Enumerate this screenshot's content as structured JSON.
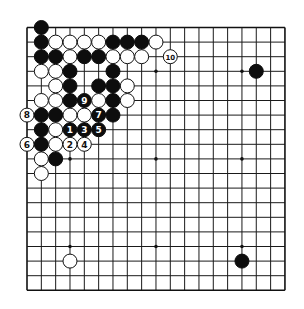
{
  "board": {
    "size": 19,
    "origin_x": 27,
    "origin_y": 27.5,
    "spacing_x": 14.33,
    "spacing_y": 14.6,
    "stone_radius": 7,
    "colors": {
      "black": "#0d0d0d",
      "white": "#ffffff",
      "line": "#1a1a1a"
    },
    "star_points": [
      [
        3,
        3
      ],
      [
        9,
        3
      ],
      [
        15,
        3
      ],
      [
        3,
        9
      ],
      [
        9,
        9
      ],
      [
        15,
        9
      ],
      [
        3,
        15
      ],
      [
        9,
        15
      ],
      [
        15,
        15
      ]
    ]
  },
  "stones": [
    {
      "c": 1,
      "r": 0,
      "color": "black"
    },
    {
      "c": 1,
      "r": 1,
      "color": "black"
    },
    {
      "c": 2,
      "r": 1,
      "color": "white"
    },
    {
      "c": 3,
      "r": 1,
      "color": "white"
    },
    {
      "c": 4,
      "r": 1,
      "color": "white"
    },
    {
      "c": 5,
      "r": 1,
      "color": "white"
    },
    {
      "c": 6,
      "r": 1,
      "color": "black"
    },
    {
      "c": 7,
      "r": 1,
      "color": "black"
    },
    {
      "c": 8,
      "r": 1,
      "color": "black"
    },
    {
      "c": 9,
      "r": 1,
      "color": "white"
    },
    {
      "c": 1,
      "r": 2,
      "color": "black"
    },
    {
      "c": 2,
      "r": 2,
      "color": "black"
    },
    {
      "c": 3,
      "r": 2,
      "color": "white"
    },
    {
      "c": 4,
      "r": 2,
      "color": "black"
    },
    {
      "c": 5,
      "r": 2,
      "color": "black"
    },
    {
      "c": 6,
      "r": 2,
      "color": "white"
    },
    {
      "c": 7,
      "r": 2,
      "color": "white"
    },
    {
      "c": 8,
      "r": 2,
      "color": "white"
    },
    {
      "c": 10,
      "r": 2,
      "color": "white",
      "label": "10"
    },
    {
      "c": 1,
      "r": 3,
      "color": "white"
    },
    {
      "c": 2,
      "r": 3,
      "color": "white"
    },
    {
      "c": 3,
      "r": 3,
      "color": "black"
    },
    {
      "c": 6,
      "r": 3,
      "color": "black"
    },
    {
      "c": 16,
      "r": 3,
      "color": "black"
    },
    {
      "c": 2,
      "r": 4,
      "color": "white"
    },
    {
      "c": 3,
      "r": 4,
      "color": "black"
    },
    {
      "c": 5,
      "r": 4,
      "color": "black"
    },
    {
      "c": 6,
      "r": 4,
      "color": "black"
    },
    {
      "c": 7,
      "r": 4,
      "color": "white"
    },
    {
      "c": 1,
      "r": 5,
      "color": "white"
    },
    {
      "c": 2,
      "r": 5,
      "color": "white"
    },
    {
      "c": 3,
      "r": 5,
      "color": "black"
    },
    {
      "c": 4,
      "r": 5,
      "color": "black",
      "label": "9"
    },
    {
      "c": 5,
      "r": 5,
      "color": "white"
    },
    {
      "c": 6,
      "r": 5,
      "color": "black"
    },
    {
      "c": 7,
      "r": 5,
      "color": "white"
    },
    {
      "c": 0,
      "r": 6,
      "color": "white",
      "label": "8"
    },
    {
      "c": 1,
      "r": 6,
      "color": "black"
    },
    {
      "c": 2,
      "r": 6,
      "color": "black"
    },
    {
      "c": 3,
      "r": 6,
      "color": "white"
    },
    {
      "c": 4,
      "r": 6,
      "color": "white"
    },
    {
      "c": 5,
      "r": 6,
      "color": "black",
      "label": "7"
    },
    {
      "c": 6,
      "r": 6,
      "color": "black"
    },
    {
      "c": 1,
      "r": 7,
      "color": "black"
    },
    {
      "c": 2,
      "r": 7,
      "color": "white"
    },
    {
      "c": 3,
      "r": 7,
      "color": "black",
      "label": "1"
    },
    {
      "c": 4,
      "r": 7,
      "color": "black",
      "label": "3"
    },
    {
      "c": 5,
      "r": 7,
      "color": "black",
      "label": "5"
    },
    {
      "c": 0,
      "r": 8,
      "color": "white",
      "label": "6"
    },
    {
      "c": 1,
      "r": 8,
      "color": "black"
    },
    {
      "c": 2,
      "r": 8,
      "color": "white"
    },
    {
      "c": 3,
      "r": 8,
      "color": "white",
      "label": "2"
    },
    {
      "c": 4,
      "r": 8,
      "color": "white",
      "label": "4"
    },
    {
      "c": 1,
      "r": 9,
      "color": "white"
    },
    {
      "c": 2,
      "r": 9,
      "color": "black"
    },
    {
      "c": 1,
      "r": 10,
      "color": "white"
    },
    {
      "c": 3,
      "r": 16,
      "color": "white"
    },
    {
      "c": 15,
      "r": 16,
      "color": "black"
    }
  ]
}
